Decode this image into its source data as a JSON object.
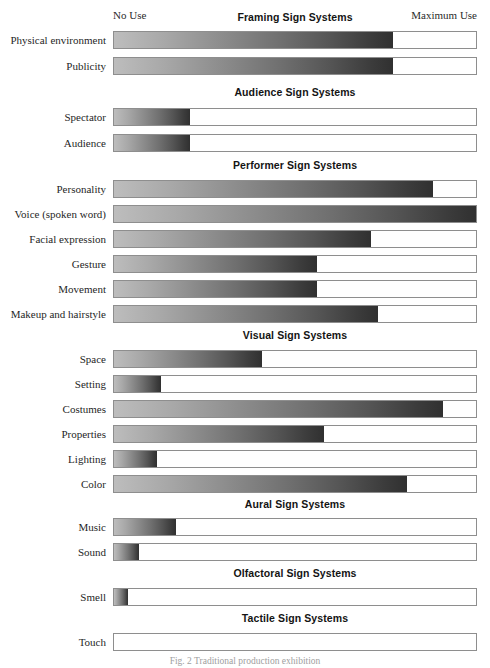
{
  "figure": {
    "caption": "Fig. 2  Traditional production exhibition",
    "scale": {
      "min_label": "No Use",
      "max_label": "Maximum Use"
    },
    "geometry": {
      "track_left_px": 113,
      "track_width_px": 364,
      "row_height_px": 18
    },
    "colors": {
      "gradient_start": "#bdbdbd",
      "gradient_end": "#303030",
      "track_border": "#8e8e8e",
      "track_background": "#ffffff",
      "text": "#1f1f1f"
    }
  },
  "chart_data": {
    "type": "bar",
    "title": "Traditional production exhibition",
    "orientation": "horizontal",
    "xlabel": "",
    "ylabel": "",
    "xlim": [
      0,
      100
    ],
    "x_axis_min_label": "No Use",
    "x_axis_max_label": "Maximum Use",
    "grid": false,
    "legend": "none",
    "value_unit": "percent of maximum use",
    "categories": [
      "Physical environment",
      "Publicity",
      "Spectator",
      "Audience",
      "Personality",
      "Voice (spoken word)",
      "Facial expression",
      "Gesture",
      "Movement",
      "Makeup and hairstyle",
      "Space",
      "Setting",
      "Costumes",
      "Properties",
      "Lighting",
      "Color",
      "Music",
      "Sound",
      "Smell",
      "Touch"
    ],
    "values": [
      77,
      77,
      21,
      21,
      88,
      100,
      71,
      56,
      56,
      73,
      41,
      13,
      91,
      58,
      12,
      81,
      17,
      7,
      4,
      0
    ],
    "groups": [
      {
        "title": "Framing Sign Systems",
        "top_px": 10,
        "rows": [
          {
            "label": "Physical environment",
            "value": 77,
            "top_px": 31
          },
          {
            "label": "Publicity",
            "value": 77,
            "top_px": 57
          }
        ]
      },
      {
        "title": "Audience Sign Systems",
        "top_px": 85,
        "rows": [
          {
            "label": "Spectator",
            "value": 21,
            "top_px": 108
          },
          {
            "label": "Audience",
            "value": 21,
            "top_px": 134
          }
        ]
      },
      {
        "title": "Performer Sign Systems",
        "top_px": 158,
        "rows": [
          {
            "label": "Personality",
            "value": 88,
            "top_px": 180
          },
          {
            "label": "Voice (spoken word)",
            "value": 100,
            "top_px": 205
          },
          {
            "label": "Facial expression",
            "value": 71,
            "top_px": 230
          },
          {
            "label": "Gesture",
            "value": 56,
            "top_px": 255
          },
          {
            "label": "Movement",
            "value": 56,
            "top_px": 280
          },
          {
            "label": "Makeup and hairstyle",
            "value": 73,
            "top_px": 305
          }
        ]
      },
      {
        "title": "Visual Sign Systems",
        "top_px": 328,
        "rows": [
          {
            "label": "Space",
            "value": 41,
            "top_px": 350
          },
          {
            "label": "Setting",
            "value": 13,
            "top_px": 375
          },
          {
            "label": "Costumes",
            "value": 91,
            "top_px": 400
          },
          {
            "label": "Properties",
            "value": 58,
            "top_px": 425
          },
          {
            "label": "Lighting",
            "value": 12,
            "top_px": 450
          },
          {
            "label": "Color",
            "value": 81,
            "top_px": 475
          }
        ]
      },
      {
        "title": "Aural Sign Systems",
        "top_px": 497,
        "rows": [
          {
            "label": "Music",
            "value": 17,
            "top_px": 518
          },
          {
            "label": "Sound",
            "value": 7,
            "top_px": 543
          }
        ]
      },
      {
        "title": "Olfactoral Sign Systems",
        "top_px": 566,
        "rows": [
          {
            "label": "Smell",
            "value": 4,
            "top_px": 588
          }
        ]
      },
      {
        "title": "Tactile Sign Systems",
        "top_px": 611,
        "rows": [
          {
            "label": "Touch",
            "value": 0,
            "top_px": 633
          }
        ]
      }
    ]
  }
}
